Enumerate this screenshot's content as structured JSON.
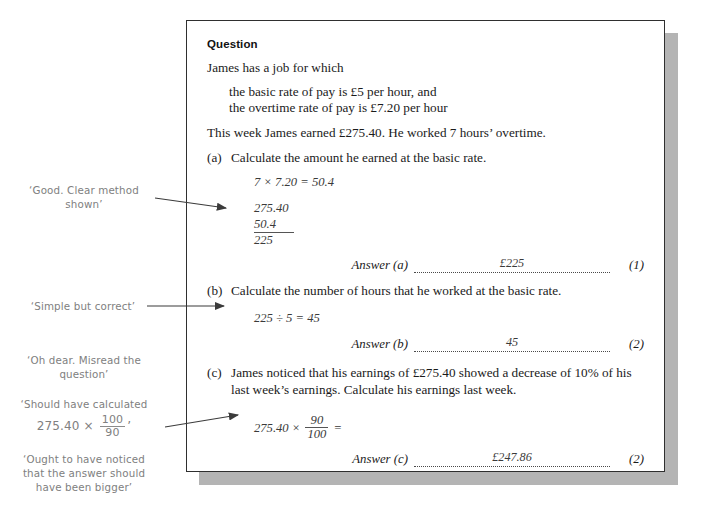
{
  "page": {
    "card_title": "Question"
  },
  "question": {
    "heading": "Question",
    "intro": "James has a job for which",
    "rates": [
      "the basic rate of pay is £5 per hour, and",
      "the overtime rate of pay is £7.20 per hour"
    ],
    "context": "This week James earned £275.40. He worked 7 hours’ overtime.",
    "parts": [
      {
        "label": "(a)",
        "text": "Calculate the amount he earned at the basic rate.",
        "work": [
          "7 × 7.20 = 50.4"
        ],
        "sum": [
          "275.40",
          "50.4",
          "225"
        ],
        "answer_label": "Answer (a)",
        "answer_value": "£225",
        "marks": "(1)"
      },
      {
        "label": "(b)",
        "text": "Calculate the number of hours that he worked at the basic rate.",
        "work": [
          "225 ÷ 5 = 45"
        ],
        "answer_label": "Answer (b)",
        "answer_value": "45",
        "marks": "(2)"
      },
      {
        "label": "(c)",
        "text": "James noticed that his earnings of £275.40 showed a decrease of 10% of his last week’s earnings. Calculate his earnings last week.",
        "work_prefix": "275.40 ×",
        "work_fraction": {
          "numerator": "90",
          "denominator": "100"
        },
        "work_suffix": "=",
        "answer_label": "Answer (c)",
        "answer_value": "£247.86",
        "marks": "(2)"
      }
    ]
  },
  "annotations": [
    {
      "id": "note-a",
      "lines": [
        "‘Good. Clear method",
        "shown’"
      ]
    },
    {
      "id": "note-b",
      "lines": [
        "‘Simple but correct’"
      ]
    },
    {
      "id": "note-c1",
      "lines": [
        "‘Oh dear. Misread the",
        "question’"
      ]
    },
    {
      "id": "note-c2",
      "lead": "‘Should have calculated",
      "expr_prefix": "275.40 ×",
      "expr_fraction": {
        "numerator": "100",
        "denominator": "90"
      },
      "expr_suffix": "’"
    },
    {
      "id": "note-c3",
      "lines": [
        "‘Ought to have noticed",
        "that the answer should",
        "have been bigger’"
      ]
    }
  ],
  "colors": {
    "page_background": "#ffffff",
    "card_background": "#ffffff",
    "card_border": "#2f2f2f",
    "card_shadow": "#b4b4b4",
    "body_text": "#1b1b1b",
    "pupil_work": "#3a3a3a",
    "annotation_text": "#808080",
    "arrow": "#3b3b3b"
  }
}
